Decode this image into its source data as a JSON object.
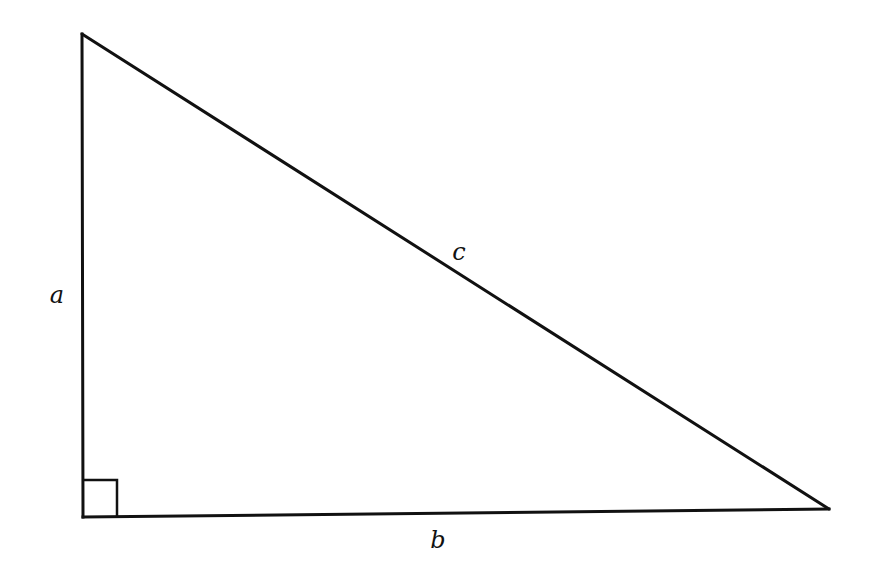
{
  "diagram": {
    "type": "right-triangle",
    "stroke_color": "#111111",
    "background": "#ffffff",
    "vertices": {
      "top": [
        82,
        34
      ],
      "bottom_left": [
        83,
        517
      ],
      "bottom_right": [
        829,
        509
      ]
    },
    "right_angle_marker": {
      "x": 84,
      "y": 480,
      "size": 33
    },
    "labels": {
      "a": {
        "text": "a",
        "x": 57,
        "y": 295,
        "side": "vertical leg"
      },
      "b": {
        "text": "b",
        "x": 438,
        "y": 540,
        "side": "horizontal leg"
      },
      "c": {
        "text": "c",
        "x": 459,
        "y": 252,
        "side": "hypotenuse"
      }
    }
  }
}
